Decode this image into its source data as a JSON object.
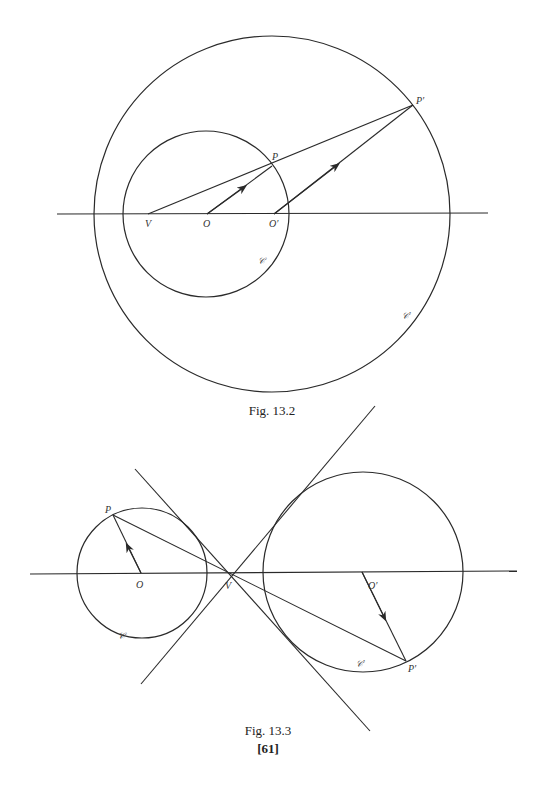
{
  "figures": [
    {
      "caption": "Fig. 13.2",
      "labels": {
        "V": "V",
        "O": "O",
        "O_prime": "O′",
        "P": "P",
        "P_prime": "P′",
        "C": "𝒞",
        "C_prime": "𝒞′"
      }
    },
    {
      "caption": "Fig. 13.3",
      "labels": {
        "V": "V",
        "O": "O",
        "O_prime": "O′",
        "P": "P",
        "P_prime": "P′",
        "C": "𝒞",
        "C_prime": "𝒞′"
      }
    }
  ],
  "page_number": "[61]"
}
